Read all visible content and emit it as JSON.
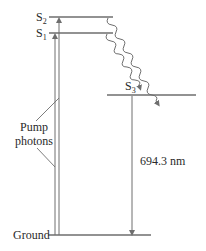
{
  "diagram": {
    "type": "energy-level diagram (ruby laser)",
    "levels": [
      {
        "id": "S2",
        "label_main": "S",
        "label_sub": "2"
      },
      {
        "id": "S1",
        "label_main": "S",
        "label_sub": "1"
      },
      {
        "id": "S3",
        "label_main": "S",
        "label_sub": "3"
      },
      {
        "id": "ground",
        "label": "Ground"
      }
    ],
    "pump_label_line1": "Pump",
    "pump_label_line2": "photons",
    "emission_label": "694.3 nm",
    "colors": {
      "line": "#6e6e6e",
      "text": "#2a2a2a",
      "background": "#ffffff"
    }
  }
}
